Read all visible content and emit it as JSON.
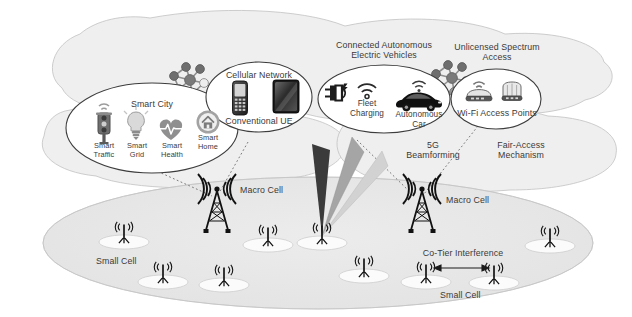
{
  "diagram": {
    "background": "#ffffff",
    "colors": {
      "cloud_fill": "#efefef",
      "cloud_stroke": "#b9b9b9",
      "ellipse_fill": "#ffffff",
      "ellipse_stroke": "#3d3d3d",
      "ground_fill": "#e9e9e9",
      "text": "#3a3a3a",
      "beam_dark": "#3b3b3b",
      "beam_mid": "#9a9a9a",
      "beam_light": "#cfcfcf",
      "tower": "#1b1b1b",
      "pad_fill": "#fbfbfb"
    }
  },
  "clouds": [
    {
      "name": "upper-left-cloud"
    },
    {
      "name": "upper-right-cloud"
    },
    {
      "name": "mid-left-cloud"
    },
    {
      "name": "mid-right-cloud"
    }
  ],
  "domains": [
    {
      "id": "smart-city",
      "label": "Smart City",
      "icons": [
        {
          "name": "traffic-light-icon",
          "label": "Smart\nTraffic"
        },
        {
          "name": "lightbulb-icon",
          "label": "Smart\nGrid"
        },
        {
          "name": "heartbeat-icon",
          "label": "Smart\nHealth"
        },
        {
          "name": "smart-home-icon",
          "label": "Smart\nHome"
        }
      ]
    },
    {
      "id": "cellular-network",
      "label": "Cellular Network",
      "caption": "Conventional UE",
      "icons": [
        {
          "name": "feature-phone-icon"
        },
        {
          "name": "tablet-icon"
        }
      ]
    },
    {
      "id": "connected-autonomous-electric-vehicles",
      "label": "Connected Autonomous\nElectric Vehicles",
      "icons": [
        {
          "name": "ev-charging-plug-icon",
          "label": "Fleet\nCharging"
        },
        {
          "name": "autonomous-car-icon",
          "label": "Autonomous\nCar"
        }
      ]
    },
    {
      "id": "unlicensed-spectrum-access",
      "label": "Unlicensed Spectrum\nAccess",
      "caption": "Wi-Fi Access Points",
      "icons": [
        {
          "name": "wifi-router-icon"
        },
        {
          "name": "wifi-router-secondary-icon"
        }
      ]
    }
  ],
  "annotations": [
    {
      "id": "beamforming",
      "label": "5G\nBeamforming"
    },
    {
      "id": "fair-access",
      "label": "Fair-Access\nMechanism"
    },
    {
      "id": "co-tier",
      "label": "Co-Tier Interference"
    }
  ],
  "ground": {
    "macro_cells": [
      {
        "name": "macro-cell-left",
        "label": "Macro Cell"
      },
      {
        "name": "macro-cell-right",
        "label": "Macro Cell"
      }
    ],
    "small_cell_labels": [
      {
        "name": "small-cell-label-left",
        "label": "Small Cell"
      },
      {
        "name": "small-cell-label-right",
        "label": "Small Cell"
      }
    ],
    "small_cell_count": 10,
    "beam_count": 3
  }
}
